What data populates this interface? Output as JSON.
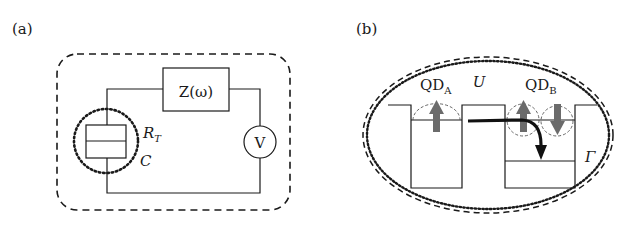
{
  "panel_a": {
    "label": "(a)",
    "impedance": "Z(ω)",
    "voltmeter": "V",
    "junction_r": "R",
    "junction_r_sub": "T",
    "junction_c": "C"
  },
  "panel_b": {
    "label": "(b)",
    "qd_a": "QD",
    "qd_a_sub": "A",
    "qd_b": "QD",
    "qd_b_sub": "B",
    "interaction": "U",
    "tunneling": "Γ"
  },
  "colors": {
    "line": "#1a1a1a",
    "spin_arrow": "#6b6b6b",
    "background": "#ffffff"
  }
}
